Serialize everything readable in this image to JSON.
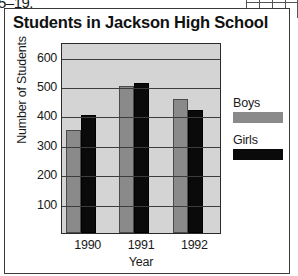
{
  "page_artifacts": {
    "top_left_fragment": "5–19."
  },
  "figure": {
    "title": "Students in Jackson High School"
  },
  "legend": {
    "position": "right",
    "entries": [
      {
        "label": "Boys",
        "color": "#8a8a8a"
      },
      {
        "label": "Girls",
        "color": "#0a0a0a"
      }
    ]
  },
  "chart_data": {
    "type": "bar",
    "title": "Students in Jackson High School",
    "xlabel": "Year",
    "ylabel": "Number of Students",
    "categories": [
      "1990",
      "1991",
      "1992"
    ],
    "series": [
      {
        "name": "Boys",
        "color": "#8a8a8a",
        "values": [
          350,
          500,
          455
        ]
      },
      {
        "name": "Girls",
        "color": "#0a0a0a",
        "values": [
          400,
          510,
          420
        ]
      }
    ],
    "ylim": [
      0,
      650
    ],
    "yticks": [
      100,
      200,
      300,
      400,
      500,
      600
    ],
    "ytick_labels": [
      "100",
      "200",
      "300",
      "400",
      "500",
      "600"
    ],
    "grid": true,
    "grid_axis": "y",
    "plot_background": "#d4d4d4"
  }
}
